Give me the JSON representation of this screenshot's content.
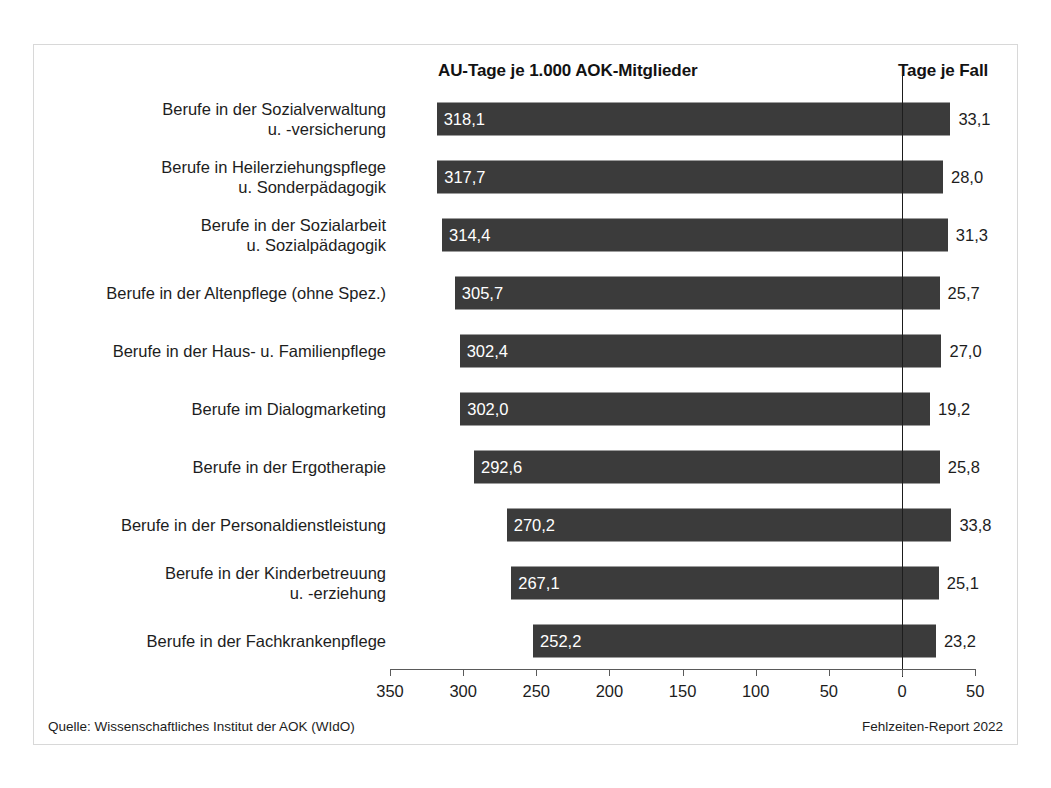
{
  "headers": {
    "left": "AU-Tage je 1.000 AOK-Mitglieder",
    "right": "Tage je Fall"
  },
  "footer": {
    "source": "Quelle: Wissenschaftliches Institut der AOK (WIdO)",
    "report": "Fehlzeiten-Report 2022"
  },
  "colors": {
    "bar": "#3b3b3b",
    "frame": "#d8d8d8",
    "axis": "#5a5a5a",
    "text": "#1d1d1d",
    "bar_label": "#ffffff"
  },
  "chart_data": {
    "type": "bar",
    "orientation": "horizontal-reversed",
    "title": "AU-Tage je 1.000 AOK-Mitglieder",
    "xlabel": "",
    "ylabel": "",
    "grid": false,
    "legend": "none",
    "axis_ticks": [
      "350",
      "300",
      "250",
      "200",
      "150",
      "100",
      "50",
      "0",
      "50"
    ],
    "axis_tick_values": [
      350,
      300,
      250,
      200,
      150,
      100,
      50,
      0,
      -50
    ],
    "xlim": [
      350,
      -50
    ],
    "zero_at": 0,
    "categories": [
      "Berufe in der Sozialverwaltung\nu. -versicherung",
      "Berufe in Heilerziehungspflege\nu. Sonderpädagogik",
      "Berufe in der Sozialarbeit\nu. Sozialpädagogik",
      "Berufe in der Altenpflege (ohne Spez.)",
      "Berufe in der Haus- u. Familienpflege",
      "Berufe im Dialogmarketing",
      "Berufe in der Ergotherapie",
      "Berufe in der Personaldienstleistung",
      "Berufe in der Kinderbetreuung\nu. -erziehung",
      "Berufe in der Fachkrankenpflege"
    ],
    "series": [
      {
        "name": "AU-Tage je 1.000 AOK-Mitglieder",
        "values": [
          318.1,
          317.7,
          314.4,
          305.7,
          302.4,
          302.0,
          292.6,
          270.2,
          267.1,
          252.2
        ],
        "labels": [
          "318,1",
          "317,7",
          "314,4",
          "305,7",
          "302,4",
          "302,0",
          "292,6",
          "270,2",
          "267,1",
          "252,2"
        ]
      },
      {
        "name": "Tage je Fall",
        "values": [
          33.1,
          28.0,
          31.3,
          25.7,
          27.0,
          19.2,
          25.8,
          33.8,
          25.1,
          23.2
        ],
        "labels": [
          "33,1",
          "28,0",
          "31,3",
          "25,7",
          "27,0",
          "19,2",
          "25,8",
          "33,8",
          "25,1",
          "23,2"
        ]
      }
    ]
  }
}
